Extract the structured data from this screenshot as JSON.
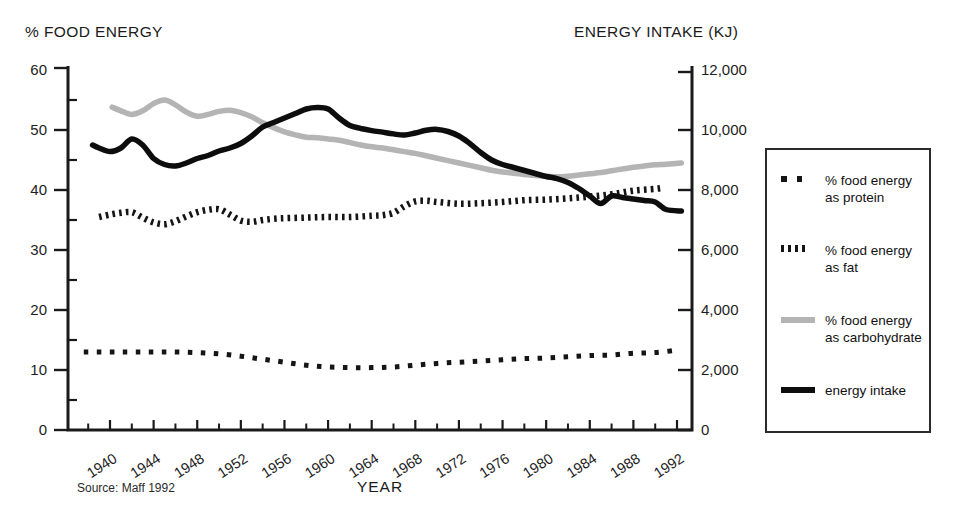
{
  "chart": {
    "left_axis_title": "% FOOD ENERGY",
    "right_axis_title": "ENERGY INTAKE (KJ)",
    "x_axis_title": "YEAR",
    "source": "Source: Maff 1992"
  },
  "legend": {
    "position": "right",
    "items": [
      {
        "id": "protein",
        "marker": "sparse-square-dots",
        "label": "% food energy as protein"
      },
      {
        "id": "fat",
        "marker": "dense-dashes",
        "label": "% food energy as fat"
      },
      {
        "id": "carbohydrate",
        "marker": "gray-solid-line",
        "label": "% food energy as carbohydrate"
      },
      {
        "id": "energy",
        "marker": "black-solid-line",
        "label": "energy intake"
      }
    ]
  },
  "colors": {
    "ink": "#151515",
    "gray_line": "#b4b4b4",
    "axis": "#1a1a1a",
    "text": "#1d1d1d"
  },
  "chart_data": {
    "type": "line",
    "title": "",
    "xlabel": "YEAR",
    "ylabel_left": "% FOOD ENERGY",
    "ylabel_right": "ENERGY INTAKE (KJ)",
    "source": "Source: Maff 1992",
    "grid": false,
    "legend_position": "right",
    "x_range": [
      1936,
      1993.5
    ],
    "y_left_range": [
      0,
      60
    ],
    "y_right_range": [
      0,
      12000
    ],
    "x_major_ticks": [
      1940,
      1944,
      1948,
      1952,
      1956,
      1960,
      1964,
      1968,
      1972,
      1976,
      1980,
      1984,
      1988,
      1992
    ],
    "x_minor_ticks": [
      1938,
      1942,
      1946,
      1950,
      1954,
      1958,
      1962,
      1966,
      1970,
      1974,
      1978,
      1982,
      1986,
      1990
    ],
    "y_left_major_ticks": [
      0,
      10,
      20,
      30,
      40,
      50,
      60
    ],
    "y_left_minor_ticks": [
      5,
      15,
      25,
      35,
      45,
      55
    ],
    "y_right_major_ticks": [
      {
        "v": 0,
        "label": "0"
      },
      {
        "v": 2000,
        "label": "2,000"
      },
      {
        "v": 4000,
        "label": "4,000"
      },
      {
        "v": 6000,
        "label": "6,000"
      },
      {
        "v": 8000,
        "label": "8,000"
      },
      {
        "v": 10000,
        "label": "10,000"
      },
      {
        "v": 12000,
        "label": "12,000"
      }
    ],
    "series": [
      {
        "name": "% food energy as protein",
        "axis": "left",
        "style": "square-dotted",
        "color": "#151515",
        "points": [
          [
            1937.6,
            13
          ],
          [
            1940,
            13
          ],
          [
            1942,
            13
          ],
          [
            1944,
            13
          ],
          [
            1946,
            13
          ],
          [
            1948,
            12.9
          ],
          [
            1950,
            12.7
          ],
          [
            1952,
            12.3
          ],
          [
            1954,
            11.8
          ],
          [
            1956,
            11.3
          ],
          [
            1958,
            10.8
          ],
          [
            1960,
            10.5
          ],
          [
            1962,
            10.4
          ],
          [
            1964,
            10.4
          ],
          [
            1966,
            10.5
          ],
          [
            1968,
            10.8
          ],
          [
            1970,
            11.1
          ],
          [
            1972,
            11.3
          ],
          [
            1974,
            11.5
          ],
          [
            1976,
            11.7
          ],
          [
            1978,
            11.9
          ],
          [
            1980,
            12.0
          ],
          [
            1982,
            12.2
          ],
          [
            1984,
            12.4
          ],
          [
            1986,
            12.5
          ],
          [
            1988,
            12.8
          ],
          [
            1990,
            12.9
          ],
          [
            1992,
            13.3
          ]
        ]
      },
      {
        "name": "% food energy as fat",
        "axis": "left",
        "style": "dash-dotted",
        "color": "#151515",
        "points": [
          [
            1939,
            35.5
          ],
          [
            1940,
            35.9
          ],
          [
            1941,
            36.2
          ],
          [
            1942,
            36.3
          ],
          [
            1943,
            35.4
          ],
          [
            1944,
            34.6
          ],
          [
            1945,
            34.3
          ],
          [
            1946,
            34.8
          ],
          [
            1947,
            35.6
          ],
          [
            1948,
            36.3
          ],
          [
            1949,
            36.7
          ],
          [
            1950,
            36.8
          ],
          [
            1951,
            35.9
          ],
          [
            1952,
            34.9
          ],
          [
            1953,
            34.7
          ],
          [
            1954,
            35.0
          ],
          [
            1955,
            35.2
          ],
          [
            1956,
            35.3
          ],
          [
            1958,
            35.4
          ],
          [
            1960,
            35.5
          ],
          [
            1962,
            35.5
          ],
          [
            1964,
            35.7
          ],
          [
            1965,
            35.8
          ],
          [
            1966,
            36.2
          ],
          [
            1967,
            37.3
          ],
          [
            1968,
            38.1
          ],
          [
            1969,
            38.2
          ],
          [
            1970,
            38.0
          ],
          [
            1972,
            37.7
          ],
          [
            1974,
            37.8
          ],
          [
            1976,
            38.0
          ],
          [
            1978,
            38.3
          ],
          [
            1980,
            38.4
          ],
          [
            1982,
            38.6
          ],
          [
            1984,
            38.9
          ],
          [
            1986,
            39.3
          ],
          [
            1988,
            39.9
          ],
          [
            1990,
            40.2
          ],
          [
            1990.8,
            40.4
          ]
        ]
      },
      {
        "name": "% food energy as carbohydrate",
        "axis": "left",
        "style": "solid",
        "color": "#b4b4b4",
        "points": [
          [
            1940.2,
            53.8
          ],
          [
            1941,
            53.2
          ],
          [
            1942,
            52.6
          ],
          [
            1943,
            53.2
          ],
          [
            1944,
            54.4
          ],
          [
            1945,
            55.0
          ],
          [
            1946,
            54.2
          ],
          [
            1947,
            53.0
          ],
          [
            1948,
            52.3
          ],
          [
            1949,
            52.6
          ],
          [
            1950,
            53.1
          ],
          [
            1951,
            53.3
          ],
          [
            1952,
            52.9
          ],
          [
            1953,
            52.2
          ],
          [
            1954,
            51.2
          ],
          [
            1955,
            50.4
          ],
          [
            1956,
            49.7
          ],
          [
            1957,
            49.2
          ],
          [
            1958,
            48.8
          ],
          [
            1959,
            48.7
          ],
          [
            1960,
            48.5
          ],
          [
            1961,
            48.3
          ],
          [
            1962,
            47.9
          ],
          [
            1963,
            47.5
          ],
          [
            1964,
            47.2
          ],
          [
            1965,
            47.0
          ],
          [
            1966,
            46.7
          ],
          [
            1967,
            46.4
          ],
          [
            1968,
            46.1
          ],
          [
            1969,
            45.7
          ],
          [
            1970,
            45.3
          ],
          [
            1971,
            44.9
          ],
          [
            1972,
            44.5
          ],
          [
            1973,
            44.1
          ],
          [
            1974,
            43.7
          ],
          [
            1975,
            43.3
          ],
          [
            1976,
            43.0
          ],
          [
            1977,
            42.8
          ],
          [
            1978,
            42.6
          ],
          [
            1979,
            42.4
          ],
          [
            1980,
            42.3
          ],
          [
            1981,
            42.2
          ],
          [
            1982,
            42.3
          ],
          [
            1983,
            42.5
          ],
          [
            1984,
            42.7
          ],
          [
            1985,
            42.9
          ],
          [
            1986,
            43.2
          ],
          [
            1987,
            43.5
          ],
          [
            1988,
            43.8
          ],
          [
            1989,
            44.0
          ],
          [
            1990,
            44.2
          ],
          [
            1991,
            44.3
          ],
          [
            1992.4,
            44.5
          ]
        ]
      },
      {
        "name": "energy intake",
        "axis": "right",
        "style": "solid",
        "color": "#0d0d0d",
        "points": [
          [
            1938.4,
            9500
          ],
          [
            1939,
            9400
          ],
          [
            1940,
            9280
          ],
          [
            1941,
            9400
          ],
          [
            1942,
            9700
          ],
          [
            1943,
            9500
          ],
          [
            1944,
            9050
          ],
          [
            1945,
            8850
          ],
          [
            1946,
            8800
          ],
          [
            1947,
            8900
          ],
          [
            1948,
            9050
          ],
          [
            1949,
            9150
          ],
          [
            1950,
            9300
          ],
          [
            1951,
            9400
          ],
          [
            1952,
            9550
          ],
          [
            1953,
            9800
          ],
          [
            1954,
            10100
          ],
          [
            1955,
            10250
          ],
          [
            1956,
            10400
          ],
          [
            1957,
            10550
          ],
          [
            1958,
            10700
          ],
          [
            1959,
            10750
          ],
          [
            1960,
            10700
          ],
          [
            1961,
            10400
          ],
          [
            1962,
            10150
          ],
          [
            1963,
            10050
          ],
          [
            1964,
            9980
          ],
          [
            1965,
            9930
          ],
          [
            1966,
            9870
          ],
          [
            1967,
            9830
          ],
          [
            1968,
            9900
          ],
          [
            1969,
            9990
          ],
          [
            1970,
            10020
          ],
          [
            1971,
            9950
          ],
          [
            1972,
            9800
          ],
          [
            1973,
            9550
          ],
          [
            1974,
            9250
          ],
          [
            1975,
            9000
          ],
          [
            1976,
            8850
          ],
          [
            1977,
            8750
          ],
          [
            1978,
            8650
          ],
          [
            1979,
            8550
          ],
          [
            1980,
            8450
          ],
          [
            1981,
            8380
          ],
          [
            1982,
            8250
          ],
          [
            1983,
            8050
          ],
          [
            1984,
            7800
          ],
          [
            1985,
            7550
          ],
          [
            1986,
            7800
          ],
          [
            1987,
            7750
          ],
          [
            1988,
            7700
          ],
          [
            1989,
            7650
          ],
          [
            1990,
            7600
          ],
          [
            1991,
            7350
          ],
          [
            1992.4,
            7300
          ]
        ]
      }
    ]
  }
}
